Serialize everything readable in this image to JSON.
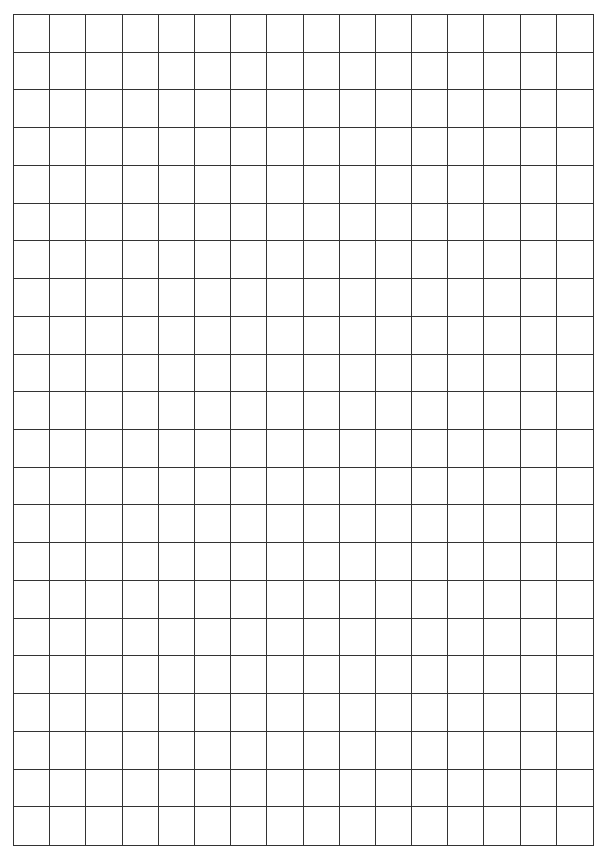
{
  "sheet": {
    "type": "blank grid paper",
    "columns": 16,
    "rows": 22,
    "line_color": "#333333",
    "background_color": "#ffffff"
  }
}
